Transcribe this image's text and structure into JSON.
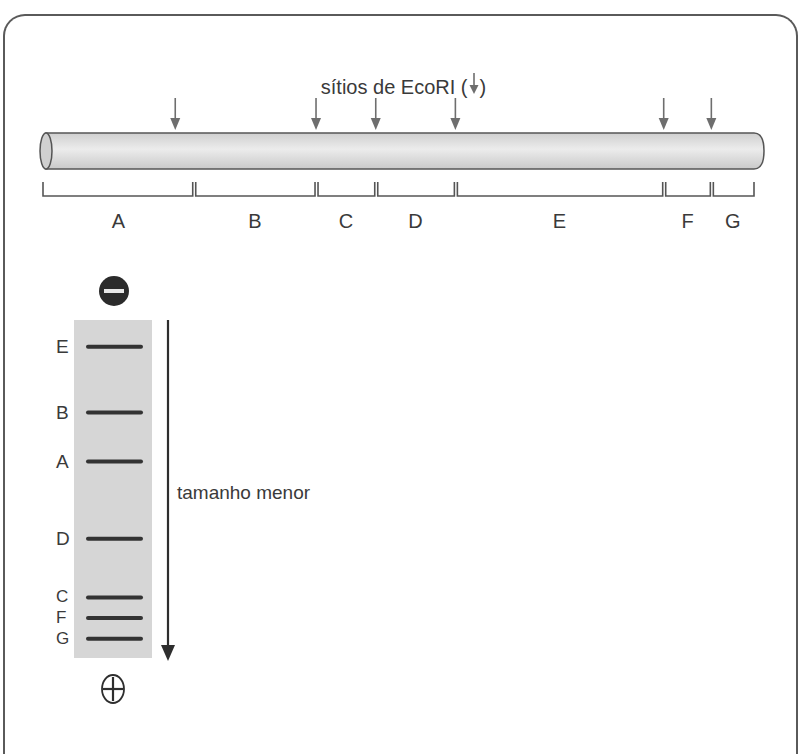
{
  "title": {
    "text_before": "sítios de EcoRI (",
    "text_after": ")",
    "arrow_icon": "down-arrow-icon"
  },
  "dna": {
    "restriction_sites_fraction": [
      0.186,
      0.384,
      0.468,
      0.58,
      0.873,
      0.94
    ],
    "fragments": [
      {
        "label": "A",
        "start": 0.0,
        "end": 0.212
      },
      {
        "label": "B",
        "start": 0.212,
        "end": 0.384
      },
      {
        "label": "C",
        "start": 0.384,
        "end": 0.468
      },
      {
        "label": "D",
        "start": 0.468,
        "end": 0.58
      },
      {
        "label": "E",
        "start": 0.58,
        "end": 0.873
      },
      {
        "label": "F",
        "start": 0.873,
        "end": 0.94
      },
      {
        "label": "G",
        "start": 0.94,
        "end": 1.0
      }
    ]
  },
  "gel": {
    "negative_icon": "minus-electrode-icon",
    "positive_icon": "plus-electrode-icon",
    "bands": [
      {
        "label": "E",
        "position": 0.07
      },
      {
        "label": "B",
        "position": 0.265
      },
      {
        "label": "A",
        "position": 0.41
      },
      {
        "label": "D",
        "position": 0.638
      },
      {
        "label": "C",
        "position": 0.812
      },
      {
        "label": "F",
        "position": 0.873
      },
      {
        "label": "G",
        "position": 0.934
      }
    ],
    "axis_label": "tamanho menor"
  },
  "colors": {
    "border": "#5a5a5a",
    "arrow": "#6e6e6e",
    "tube_fill": "#d9d9d9",
    "gel_fill": "#d6d6d6",
    "band": "#333333",
    "text": "#3a3a3a"
  }
}
